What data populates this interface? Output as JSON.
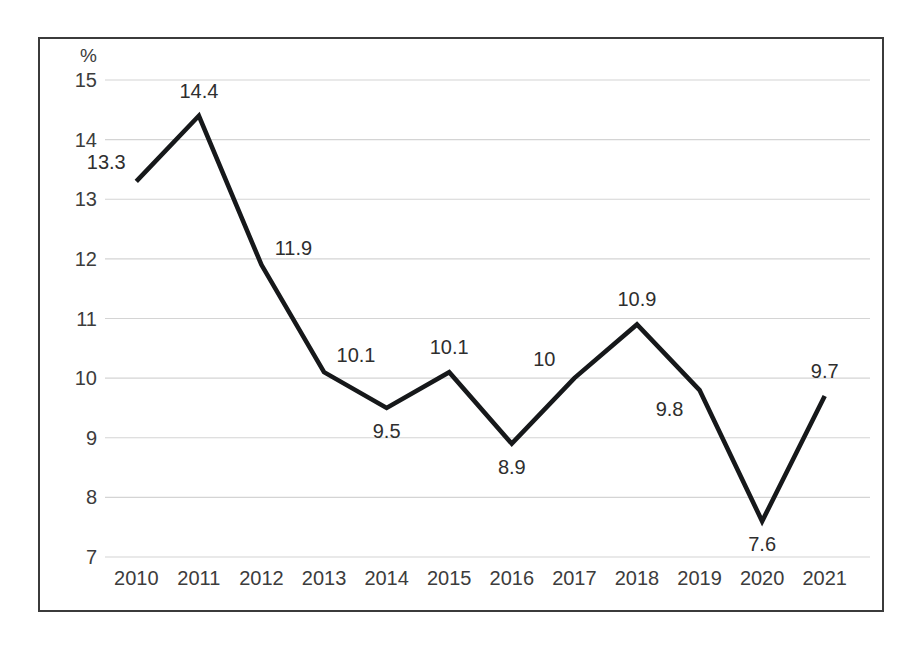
{
  "chart_data": {
    "type": "line",
    "title": "",
    "subtitle": "",
    "xlabel": "",
    "ylabel": "%",
    "unit_label": "%",
    "categories": [
      "2010",
      "2011",
      "2012",
      "2013",
      "2014",
      "2015",
      "2016",
      "2017",
      "2018",
      "2019",
      "2020",
      "2021"
    ],
    "values": [
      13.3,
      14.4,
      11.9,
      10.1,
      9.5,
      10.1,
      8.9,
      10,
      10.9,
      9.8,
      7.6,
      9.7
    ],
    "point_labels": [
      "13.3",
      "14.4",
      "11.9",
      "10.1",
      "9.5",
      "10.1",
      "8.9",
      "10",
      "10.9",
      "9.8",
      "7.6",
      "9.7"
    ],
    "label_positions": [
      "above-left",
      "above",
      "above-right",
      "above-right",
      "below",
      "above",
      "below",
      "above-left",
      "above",
      "below-left",
      "below",
      "above"
    ],
    "ylim": [
      7,
      15
    ],
    "ytick_labels": [
      "15",
      "14",
      "13",
      "12",
      "11",
      "10",
      "9",
      "8",
      "7"
    ],
    "ytick_values": [
      15,
      14,
      13,
      12,
      11,
      10,
      9,
      8,
      7
    ],
    "grid": true,
    "grid_axis": "y",
    "legend": false,
    "legend_position": "none",
    "series": [
      {
        "name": "",
        "values": [
          13.3,
          14.4,
          11.9,
          10.1,
          9.5,
          10.1,
          8.9,
          10,
          10.9,
          9.8,
          7.6,
          9.7
        ]
      }
    ]
  },
  "style": {
    "line_color": "#16181a",
    "grid_color": "#d4d4d4",
    "text_color": "#3c3c3c",
    "border_color": "#3b3b3b",
    "background": "#ffffff"
  }
}
